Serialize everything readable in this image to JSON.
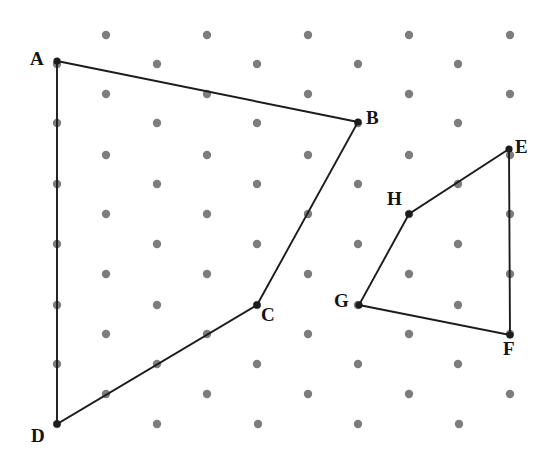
{
  "figure": {
    "canvas": {
      "width": 549,
      "height": 463,
      "background": "#ffffff"
    },
    "colors": {
      "lattice_dot": "#7d7d7d",
      "edge": "#1c1c1c",
      "vertex": "#1c1c1c",
      "label": "#141414"
    },
    "lattice": {
      "type": "triangular-staggered",
      "dot_radius": 4.2,
      "row_spacing": 30.1,
      "column_spacing": 100.7,
      "row_offset": 50.4,
      "rows": 14,
      "columns_per_row": 5,
      "origin_x": 57,
      "origin_y": 35,
      "even_row_start_x": 106,
      "odd_row_start_x": 57
    }
  },
  "vertices": [
    {
      "id": "A",
      "label": "A",
      "x": 57,
      "y": 61,
      "label_x": 30,
      "label_y": 49
    },
    {
      "id": "B",
      "label": "B",
      "x": 358,
      "y": 122,
      "label_x": 366,
      "label_y": 108
    },
    {
      "id": "C",
      "label": "C",
      "x": 257,
      "y": 305,
      "label_x": 261,
      "label_y": 305
    },
    {
      "id": "D",
      "label": "D",
      "x": 57,
      "y": 424,
      "label_x": 31,
      "label_y": 426
    },
    {
      "id": "E",
      "label": "E",
      "x": 509,
      "y": 149,
      "label_x": 515,
      "label_y": 137
    },
    {
      "id": "F",
      "label": "F",
      "x": 510,
      "y": 335,
      "label_x": 503,
      "label_y": 339
    },
    {
      "id": "G",
      "label": "G",
      "x": 359,
      "y": 305,
      "label_x": 334,
      "label_y": 291
    },
    {
      "id": "H",
      "label": "H",
      "x": 409,
      "y": 214,
      "label_x": 387,
      "label_y": 189
    }
  ],
  "polygons": [
    {
      "name": "quadrilateral-ABCD",
      "label": "ABCD",
      "vertex_ids": [
        "A",
        "B",
        "C",
        "D"
      ],
      "closed": true,
      "points": "57,61 358,122 257,305 57,424"
    },
    {
      "name": "quadrilateral-EFGH",
      "label": "EFGH",
      "vertex_ids": [
        "E",
        "F",
        "G",
        "H"
      ],
      "closed": true,
      "points": "509,149 510,335 359,305 409,214"
    }
  ],
  "lattice_dots": [
    {
      "row": 0,
      "y": 35,
      "xs": [
        106,
        207,
        308,
        409,
        510
      ]
    },
    {
      "row": 1,
      "y": 64,
      "xs": [
        57,
        157,
        257,
        358,
        458
      ]
    },
    {
      "row": 2,
      "y": 94,
      "xs": [
        106,
        207,
        308,
        409,
        510
      ]
    },
    {
      "row": 3,
      "y": 123,
      "xs": [
        57,
        157,
        257,
        358,
        458
      ]
    },
    {
      "row": 4,
      "y": 155,
      "xs": [
        106,
        207,
        308,
        409,
        510
      ]
    },
    {
      "row": 5,
      "y": 184,
      "xs": [
        57,
        157,
        257,
        358,
        458
      ]
    },
    {
      "row": 6,
      "y": 214,
      "xs": [
        106,
        207,
        308,
        409,
        510
      ]
    },
    {
      "row": 7,
      "y": 244,
      "xs": [
        57,
        157,
        257,
        358,
        458
      ]
    },
    {
      "row": 8,
      "y": 274,
      "xs": [
        106,
        207,
        308,
        409,
        510
      ]
    },
    {
      "row": 9,
      "y": 305,
      "xs": [
        57,
        157,
        257,
        358,
        458
      ]
    },
    {
      "row": 10,
      "y": 334,
      "xs": [
        106,
        207,
        308,
        409,
        510
      ]
    },
    {
      "row": 11,
      "y": 364,
      "xs": [
        57,
        157,
        257,
        358,
        458
      ]
    },
    {
      "row": 12,
      "y": 394,
      "xs": [
        106,
        207,
        308,
        409,
        510
      ]
    },
    {
      "row": 13,
      "y": 424,
      "xs": [
        57,
        157,
        258,
        358,
        459
      ]
    }
  ]
}
